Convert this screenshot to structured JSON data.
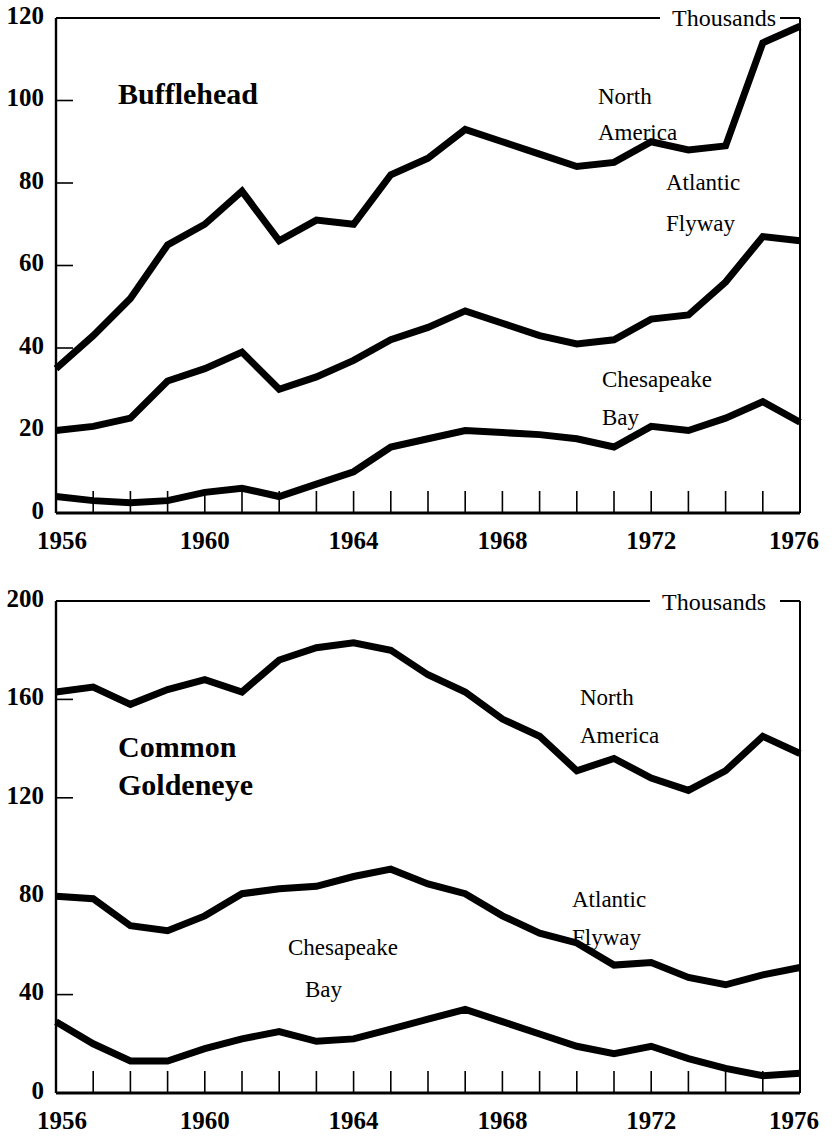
{
  "figure": {
    "units_label": "Thousands",
    "x_axis_label": "",
    "background": "#ffffff",
    "ink": "#000000"
  },
  "panels": [
    {
      "id": "bufflehead",
      "title": "Bufflehead",
      "units": "Thousands",
      "series_labels": {
        "north_america_line1": "North",
        "north_america_line2": "America",
        "atlantic_line1": "Atlantic",
        "atlantic_line2": "Flyway",
        "chesapeake_line1": "Chesapeake",
        "chesapeake_line2": "Bay"
      },
      "y_ticks": [
        "0",
        "20",
        "40",
        "60",
        "80",
        "100",
        "120"
      ],
      "x_ticks": [
        "1956",
        "1960",
        "1964",
        "1968",
        "1972",
        "1976"
      ]
    },
    {
      "id": "goldeneye",
      "title_line1": "Common",
      "title_line2": "Goldeneye",
      "units": "Thousands",
      "series_labels": {
        "north_america_line1": "North",
        "north_america_line2": "America",
        "atlantic_line1": "Atlantic",
        "atlantic_line2": "Flyway",
        "chesapeake_line1": "Chesapeake",
        "chesapeake_line2": "Bay"
      },
      "y_ticks": [
        "0",
        "40",
        "80",
        "120",
        "160",
        "200"
      ],
      "x_ticks": [
        "1956",
        "1960",
        "1964",
        "1968",
        "1972",
        "1976"
      ]
    }
  ],
  "chart_data": [
    {
      "type": "line",
      "title": "Bufflehead",
      "subtitle": "",
      "xlabel": "",
      "ylabel": "Thousands",
      "units": "Thousands",
      "grid": false,
      "legend_position": "inline-annotations",
      "xlim": [
        1956,
        1976
      ],
      "ylim": [
        0,
        120
      ],
      "yticks": [
        0,
        20,
        40,
        60,
        80,
        100,
        120
      ],
      "xticks": [
        1956,
        1960,
        1964,
        1968,
        1972,
        1976
      ],
      "xtick_minor_every": 1,
      "x": [
        1956,
        1957,
        1958,
        1959,
        1960,
        1961,
        1962,
        1963,
        1964,
        1965,
        1966,
        1967,
        1968,
        1969,
        1970,
        1971,
        1972,
        1973,
        1974,
        1975,
        1976
      ],
      "series": [
        {
          "name": "North America",
          "values": [
            35,
            43,
            52,
            65,
            70,
            78,
            66,
            71,
            70,
            82,
            86,
            93,
            90,
            87,
            84,
            85,
            90,
            88,
            89,
            114,
            118
          ]
        },
        {
          "name": "Atlantic Flyway",
          "values": [
            20,
            21,
            23,
            32,
            35,
            39,
            30,
            33,
            37,
            42,
            45,
            49,
            46,
            43,
            41,
            42,
            47,
            48,
            56,
            67,
            66
          ]
        },
        {
          "name": "Chesapeake Bay",
          "values": [
            4,
            3,
            2.5,
            3,
            5,
            6,
            4,
            7,
            10,
            16,
            18,
            20,
            19.5,
            19,
            18,
            16,
            21,
            20,
            23,
            27,
            22
          ]
        }
      ]
    },
    {
      "type": "line",
      "title": "Common Goldeneye",
      "subtitle": "",
      "xlabel": "",
      "ylabel": "Thousands",
      "units": "Thousands",
      "grid": false,
      "legend_position": "inline-annotations",
      "xlim": [
        1956,
        1976
      ],
      "ylim": [
        0,
        200
      ],
      "yticks": [
        0,
        40,
        80,
        120,
        160,
        200
      ],
      "xticks": [
        1956,
        1960,
        1964,
        1968,
        1972,
        1976
      ],
      "xtick_minor_every": 1,
      "x": [
        1956,
        1957,
        1958,
        1959,
        1960,
        1961,
        1962,
        1963,
        1964,
        1965,
        1966,
        1967,
        1968,
        1969,
        1970,
        1971,
        1972,
        1973,
        1974,
        1975,
        1976
      ],
      "series": [
        {
          "name": "North America",
          "values": [
            163,
            165,
            158,
            164,
            168,
            163,
            176,
            181,
            183,
            180,
            170,
            163,
            152,
            145,
            131,
            136,
            128,
            123,
            131,
            145,
            138
          ]
        },
        {
          "name": "Atlantic Flyway",
          "values": [
            80,
            79,
            68,
            66,
            72,
            81,
            83,
            84,
            88,
            91,
            85,
            81,
            72,
            65,
            61,
            52,
            53,
            47,
            44,
            48,
            51
          ]
        },
        {
          "name": "Chesapeake Bay",
          "values": [
            29,
            20,
            13,
            13,
            18,
            22,
            25,
            21,
            22,
            26,
            30,
            34,
            29,
            24,
            19,
            16,
            19,
            14,
            10,
            7,
            8
          ]
        }
      ]
    }
  ]
}
